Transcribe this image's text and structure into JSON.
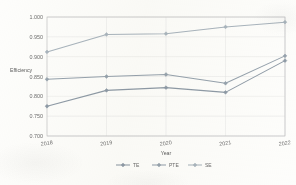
{
  "chart_data": {
    "type": "line",
    "title": "",
    "xlabel": "Year",
    "ylabel": "Efficiency",
    "categories": [
      "2018",
      "2019",
      "2020",
      "2021",
      "2022"
    ],
    "x_tick_labels": [
      "2018",
      "2019",
      "2020",
      "2021",
      "2022"
    ],
    "y_tick_labels": [
      "0.700",
      "0.750",
      "0.800",
      "0.850",
      "0.900",
      "0.950",
      "1.000"
    ],
    "y_tick_values": [
      0.7,
      0.75,
      0.8,
      0.85,
      0.9,
      0.95,
      1.0
    ],
    "ylim": [
      0.7,
      1.0
    ],
    "grid": "horizontal-and-vertical",
    "legend_position": "bottom-center",
    "marker": "filled-diamond",
    "series": [
      {
        "name": "TE",
        "color": "#8e9aa6",
        "values": [
          0.775,
          0.815,
          0.822,
          0.81,
          0.89
        ]
      },
      {
        "name": "PTE",
        "color": "#96a2ad",
        "values": [
          0.843,
          0.85,
          0.855,
          0.833,
          0.902
        ]
      },
      {
        "name": "SE",
        "color": "#a9b4bd",
        "values": [
          0.912,
          0.956,
          0.958,
          0.975,
          0.987
        ]
      }
    ]
  },
  "legend": {
    "items": [
      {
        "label": "TE"
      },
      {
        "label": "PTE"
      },
      {
        "label": "SE"
      }
    ]
  },
  "axes": {
    "y_title": "Efficiency",
    "x_title": "Year"
  }
}
